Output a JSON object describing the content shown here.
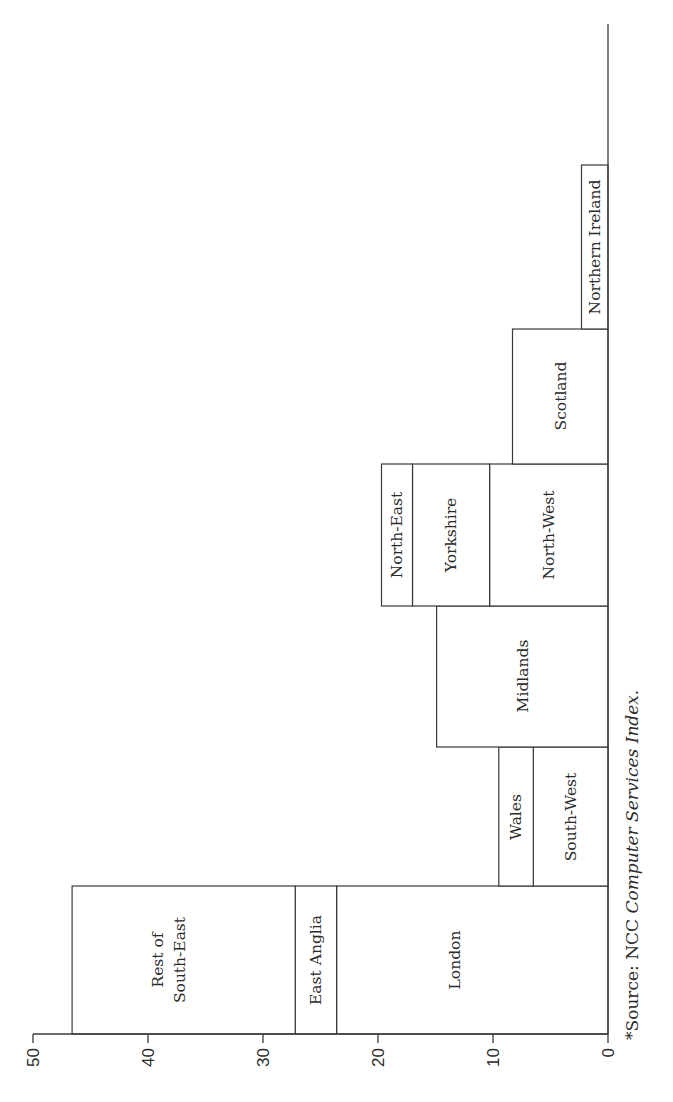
{
  "chart_data": {
    "type": "bar",
    "orientation": "stacked columns, printed rotated 90° (value axis horizontal, 0 at right)",
    "title": "",
    "xlabel": "",
    "ylabel": "",
    "ylim": [
      0,
      50
    ],
    "ticks": [
      "0",
      "10",
      "20",
      "30",
      "40",
      "50"
    ],
    "grid": false,
    "legend": null,
    "groups": [
      {
        "segments": [
          {
            "name": "London",
            "value": 23.6
          },
          {
            "name": "East Anglia",
            "value": 3.6
          },
          {
            "name": "Rest of South-East",
            "value": 19.4
          }
        ],
        "total": 46.6
      },
      {
        "segments": [
          {
            "name": "South-West",
            "value": 6.5
          },
          {
            "name": "Wales",
            "value": 3.0
          }
        ],
        "total": 9.5
      },
      {
        "segments": [
          {
            "name": "Midlands",
            "value": 14.9
          }
        ],
        "total": 14.9
      },
      {
        "segments": [
          {
            "name": "North-West",
            "value": 10.3
          },
          {
            "name": "Yorkshire",
            "value": 6.7
          },
          {
            "name": "North-East",
            "value": 2.7
          }
        ],
        "total": 19.7
      },
      {
        "segments": [
          {
            "name": "Scotland",
            "value": 8.3
          }
        ],
        "total": 8.3
      },
      {
        "segments": [
          {
            "name": "Northern Ireland",
            "value": 2.3
          }
        ],
        "total": 2.3
      }
    ],
    "source_note": "*Source: NCC Computer Services Index."
  },
  "labels": {
    "rest_of_south_east_line1": "Rest of",
    "rest_of_south_east_line2": "South-East",
    "east_anglia": "East Anglia",
    "london": "London",
    "wales": "Wales",
    "south_west": "South-West",
    "midlands": "Midlands",
    "north_east": "North-East",
    "yorkshire": "Yorkshire",
    "north_west": "North-West",
    "scotland": "Scotland",
    "northern_ireland": "Northern Ireland",
    "source_prefix": "*Source: ",
    "source_plain": "NCC ",
    "source_italic": "Computer Services Index."
  },
  "layout": {
    "zero_x": 608,
    "px_per_unit": 11.5,
    "axis_y": 1034,
    "baseline_top_y": 24,
    "group_bounds": [
      [
        886,
        1034
      ],
      [
        747,
        886
      ],
      [
        606,
        747
      ],
      [
        464,
        606
      ],
      [
        329,
        464
      ],
      [
        165,
        329
      ]
    ]
  }
}
